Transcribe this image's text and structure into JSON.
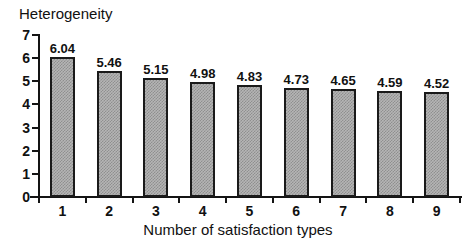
{
  "chart_data": {
    "type": "bar",
    "title": "",
    "ylabel": "Heterogeneity",
    "xlabel": "Number of satisfaction types",
    "categories": [
      "1",
      "2",
      "3",
      "4",
      "5",
      "6",
      "7",
      "8",
      "9"
    ],
    "values": [
      6.04,
      5.46,
      5.15,
      4.98,
      4.83,
      4.73,
      4.65,
      4.59,
      4.52
    ],
    "value_labels": [
      "6.04",
      "5.46",
      "5.15",
      "4.98",
      "4.83",
      "4.73",
      "4.65",
      "4.59",
      "4.52"
    ],
    "ylim": [
      0,
      7
    ],
    "ytick_labels": [
      "0",
      "1",
      "2",
      "3",
      "4",
      "5",
      "6",
      "7"
    ],
    "ytick_values": [
      0,
      1,
      2,
      3,
      4,
      5,
      6,
      7
    ],
    "grid": false,
    "legend": null,
    "series": [
      {
        "name": "Heterogeneity",
        "values": [
          6.04,
          5.46,
          5.15,
          4.98,
          4.83,
          4.73,
          4.65,
          4.59,
          4.52
        ]
      }
    ],
    "colors": {
      "bar_fill": "#b5b5b5",
      "bar_pattern": "#8f8f8f",
      "bar_border": "#1a1a1a",
      "axis": "#141414",
      "text": "#111111",
      "background": "#ffffff"
    }
  }
}
